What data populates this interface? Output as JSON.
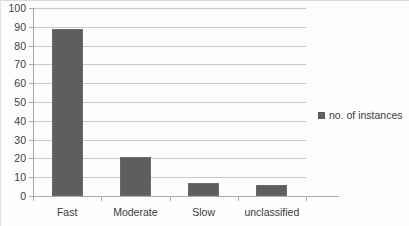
{
  "chart_data": {
    "type": "bar",
    "title": "",
    "xlabel": "",
    "ylabel": "",
    "categories": [
      "Fast",
      "Moderate",
      "Slow",
      "unclassified"
    ],
    "series": [
      {
        "name": "no. of instances",
        "values": [
          89,
          21,
          7,
          6
        ]
      }
    ],
    "ylim": [
      0,
      100
    ],
    "ytick_step": 10,
    "yticks": [
      0,
      10,
      20,
      30,
      40,
      50,
      60,
      70,
      80,
      90,
      100
    ],
    "ytick_labels": [
      "0",
      "10",
      "20",
      "30",
      "40",
      "50",
      "60",
      "70",
      "80",
      "90",
      "100"
    ],
    "grid": true,
    "grid_axis": "y",
    "legend": true,
    "legend_position": "right",
    "legend_entries": [
      "no. of instances"
    ]
  },
  "colors": {
    "bar_fill": "#5e5e5e",
    "bar_stroke": "#6b6b6b",
    "gridline": "#c9c9c9",
    "axis": "#a8a8a8",
    "text": "#3c3c3c",
    "background": "#fdfdfd"
  }
}
